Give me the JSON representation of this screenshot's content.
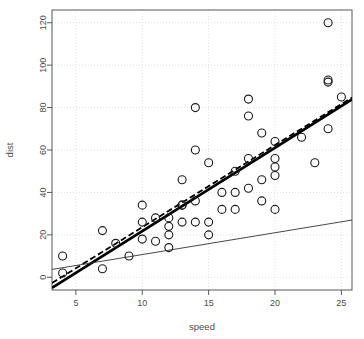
{
  "chart_data": {
    "type": "scatter",
    "title": "",
    "xlabel": "speed",
    "ylabel": "dist",
    "xlim": [
      3.2,
      25.8
    ],
    "ylim": [
      -6,
      126
    ],
    "grid": true,
    "grid_color": "#d9d9d9",
    "point_color": "#1a1a1a",
    "point_shape": "open-circle",
    "point_radius": 4,
    "xticks": [
      5,
      10,
      15,
      20,
      25
    ],
    "yticks": [
      0,
      20,
      40,
      60,
      80,
      100,
      120
    ],
    "x": [
      4,
      4,
      7,
      7,
      8,
      9,
      10,
      10,
      10,
      11,
      11,
      12,
      12,
      12,
      12,
      13,
      13,
      13,
      13,
      14,
      14,
      14,
      14,
      15,
      15,
      15,
      16,
      16,
      17,
      17,
      17,
      18,
      18,
      18,
      18,
      19,
      19,
      19,
      20,
      20,
      20,
      20,
      20,
      22,
      23,
      24,
      24,
      24,
      24,
      25
    ],
    "y": [
      2,
      10,
      4,
      22,
      16,
      10,
      18,
      26,
      34,
      17,
      28,
      14,
      20,
      24,
      28,
      26,
      34,
      34,
      46,
      26,
      36,
      60,
      80,
      20,
      26,
      54,
      32,
      40,
      32,
      40,
      50,
      42,
      56,
      76,
      84,
      36,
      46,
      68,
      32,
      48,
      52,
      56,
      64,
      66,
      54,
      70,
      92,
      93,
      120,
      85
    ],
    "series": [
      {
        "name": "ols-regression",
        "type": "line",
        "style": "solid",
        "width": 2.6,
        "color": "#000000",
        "intercept": -17.579,
        "slope": 3.932
      },
      {
        "name": "robust-regression",
        "type": "line",
        "style": "dashed",
        "width": 1.8,
        "color": "#000000",
        "dash": "6,3",
        "intercept": -15.1,
        "slope": 3.87
      },
      {
        "name": "reference-line",
        "type": "line",
        "style": "solid",
        "width": 0.9,
        "color": "#333333",
        "intercept": 0.4,
        "slope": 1.03
      }
    ]
  },
  "axes": {
    "x_title": "speed",
    "y_title": "dist",
    "x_tick_labels": [
      "5",
      "10",
      "15",
      "20",
      "25"
    ],
    "y_tick_labels": [
      "0",
      "20",
      "40",
      "60",
      "80",
      "100",
      "120"
    ]
  }
}
